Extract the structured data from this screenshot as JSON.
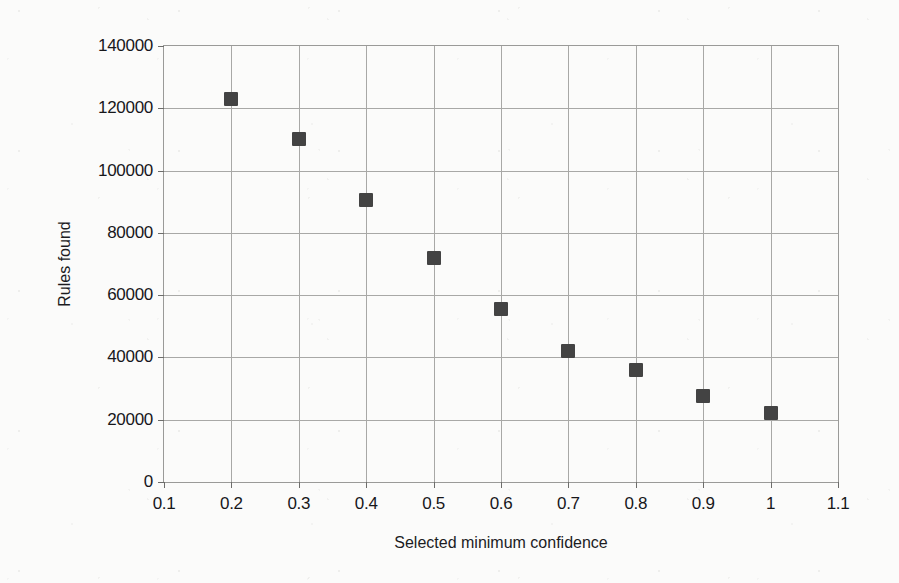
{
  "chart_data": {
    "type": "scatter",
    "title": "",
    "xlabel": "Selected minimum confidence",
    "ylabel": "Rules found",
    "xlim": [
      0.1,
      1.1
    ],
    "ylim": [
      0,
      140000
    ],
    "grid": true,
    "legend": "none",
    "marker": {
      "shape": "square",
      "color": "#434343",
      "size_px": 14
    },
    "xticks": [
      "0.1",
      "0.2",
      "0.3",
      "0.4",
      "0.5",
      "0.6",
      "0.7",
      "0.8",
      "0.9",
      "1",
      "1.1"
    ],
    "xtick_values": [
      0.1,
      0.2,
      0.3,
      0.4,
      0.5,
      0.6,
      0.7,
      0.8,
      0.9,
      1.0,
      1.1
    ],
    "yticks": [
      "0",
      "20000",
      "40000",
      "60000",
      "80000",
      "100000",
      "120000",
      "140000"
    ],
    "ytick_values": [
      0,
      20000,
      40000,
      60000,
      80000,
      100000,
      120000,
      140000
    ],
    "x": [
      0.2,
      0.3,
      0.4,
      0.5,
      0.6,
      0.7,
      0.8,
      0.9,
      1.0
    ],
    "values": [
      123000,
      110000,
      90500,
      72000,
      55500,
      42000,
      36000,
      27500,
      22000
    ],
    "points": [
      {
        "x": 0.2,
        "y": 123000
      },
      {
        "x": 0.3,
        "y": 110000
      },
      {
        "x": 0.4,
        "y": 90500
      },
      {
        "x": 0.5,
        "y": 72000
      },
      {
        "x": 0.6,
        "y": 55500
      },
      {
        "x": 0.7,
        "y": 42000
      },
      {
        "x": 0.8,
        "y": 36000
      },
      {
        "x": 0.9,
        "y": 27500
      },
      {
        "x": 1.0,
        "y": 22000
      }
    ]
  }
}
